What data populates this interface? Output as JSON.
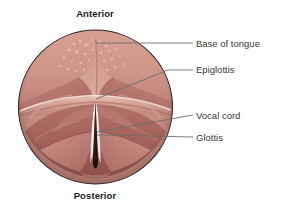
{
  "figure": {
    "background_color": "#ffffff"
  },
  "orientation": {
    "anterior": "Anterior",
    "posterior": "Posterior"
  },
  "callouts": [
    {
      "label": "Base of tongue",
      "leader": "horizontal"
    },
    {
      "label": "Epiglottis",
      "leader": "diagonal"
    },
    {
      "label": "Vocal cord",
      "leader": "diagonal"
    },
    {
      "label": "Glottis",
      "leader": "diagonal"
    }
  ],
  "anatomy": {
    "view_shape": "circle",
    "mucosa_color": "#c78b7e",
    "mucosa_light": "#d9a398",
    "mucosa_mid": "#c0857a",
    "mucosa_deep": "#a9675f",
    "shadow_color": "#8c4f49",
    "vocal_cord_color": "#f2e4dd",
    "glottis_color": "#2e1714",
    "outline_color": "#2b2b2b",
    "leader_color": "#6d6d6d"
  }
}
